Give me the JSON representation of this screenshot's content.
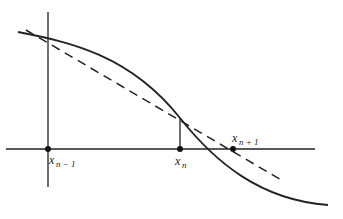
{
  "diagram": {
    "labels": {
      "x_prev": {
        "base": "x",
        "sub": "n − 1"
      },
      "x_curr": {
        "base": "x",
        "sub": "n"
      },
      "x_next": {
        "base": "x",
        "sub": "n + 1"
      }
    },
    "elements": [
      "curve f(x)",
      "secant line (dashed)",
      "x-axis",
      "y-axis",
      "vertical segment at x_n"
    ],
    "colors": {
      "ink": "#222222",
      "background": "#ffffff"
    }
  }
}
